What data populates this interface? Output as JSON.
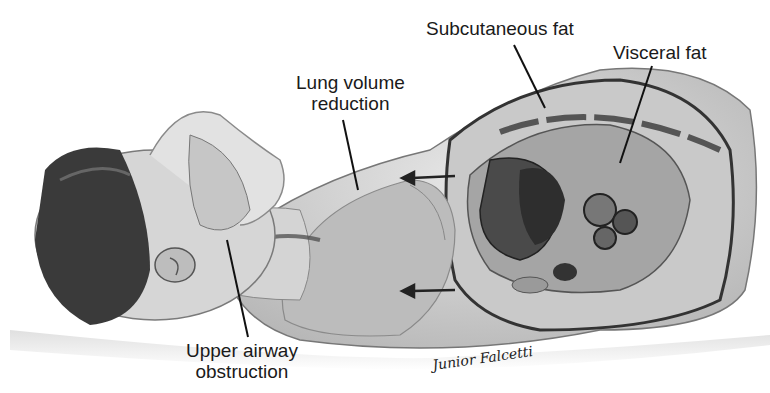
{
  "figure": {
    "labels": {
      "subcutaneous_fat": "Subcutaneous fat",
      "visceral_fat": "Visceral fat",
      "lung_volume_line1": "Lung volume",
      "lung_volume_line2": "reduction",
      "upper_airway_line1": "Upper airway",
      "upper_airway_line2": "obstruction"
    },
    "signature": "Junior Falcetti"
  }
}
